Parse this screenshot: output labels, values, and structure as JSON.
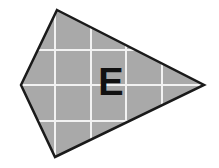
{
  "figure": {
    "name": "gray-quadrilateral-with-grid-and-label",
    "canvas": {
      "width": 219,
      "height": 168,
      "background": "#ffffff"
    },
    "shape": {
      "kind": "quadrilateral",
      "vertices": [
        {
          "name": "top",
          "x": 57,
          "y": 10
        },
        {
          "name": "right",
          "x": 204,
          "y": 85
        },
        {
          "name": "bottom",
          "x": 55,
          "y": 157
        },
        {
          "name": "left",
          "x": 21,
          "y": 85
        }
      ],
      "fill_color": "#a9a9a9",
      "stroke_color": "#1a1a1a",
      "stroke_width": 2.5
    },
    "grid": {
      "visible": true,
      "line_color": "#f2f2f2",
      "line_width": 2,
      "spacing": 35.5,
      "vertical_lines_x": [
        55,
        91,
        126,
        162
      ],
      "horizontal_lines_y": [
        50,
        85,
        121
      ]
    },
    "label": {
      "text": "E",
      "x": 111,
      "y": 85,
      "font_size": 38,
      "color": "#111111"
    }
  }
}
